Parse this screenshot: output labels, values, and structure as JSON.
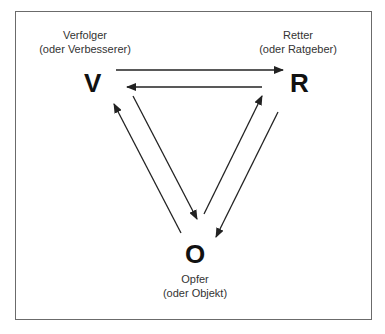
{
  "diagram": {
    "nodes": {
      "v": {
        "letter": "V",
        "name": "Verfolger",
        "alt": "(oder Verbesserer)"
      },
      "r": {
        "letter": "R",
        "name": "Retter",
        "alt": "(oder Ratgeber)"
      },
      "o": {
        "letter": "O",
        "name": "Opfer",
        "alt": "(oder Objekt)"
      }
    },
    "edges": [
      {
        "from": "V",
        "to": "R"
      },
      {
        "from": "R",
        "to": "V"
      },
      {
        "from": "V",
        "to": "O"
      },
      {
        "from": "O",
        "to": "V"
      },
      {
        "from": "R",
        "to": "O"
      },
      {
        "from": "O",
        "to": "R"
      }
    ],
    "colors": {
      "border": "#6b6b6b",
      "arrow": "#222222",
      "text": "#333333"
    }
  }
}
